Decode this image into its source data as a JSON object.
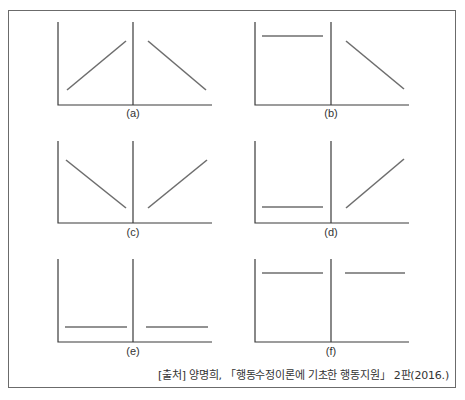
{
  "figure": {
    "panels": [
      {
        "id": "a",
        "label": "(a)",
        "left_segment": "increasing",
        "right_segment": "decreasing"
      },
      {
        "id": "b",
        "label": "(b)",
        "left_segment": "flat-high",
        "right_segment": "decreasing"
      },
      {
        "id": "c",
        "label": "(c)",
        "left_segment": "decreasing",
        "right_segment": "increasing"
      },
      {
        "id": "d",
        "label": "(d)",
        "left_segment": "flat-low",
        "right_segment": "increasing"
      },
      {
        "id": "e",
        "label": "(e)",
        "left_segment": "flat-low",
        "right_segment": "flat-low"
      },
      {
        "id": "f",
        "label": "(f)",
        "left_segment": "flat-high",
        "right_segment": "flat-high"
      }
    ],
    "source": "[출처] 양명희, 「행동수정이론에 기초한 행동지원」 2판(2016.)",
    "colors": {
      "axis": "#3a3a3a",
      "line": "#6e6e6e",
      "frame": "#6b6b6b"
    }
  }
}
